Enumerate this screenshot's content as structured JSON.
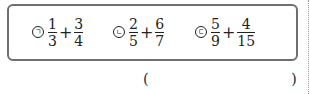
{
  "problem": {
    "options": [
      {
        "marker": "ㄱ",
        "a": {
          "num": "1",
          "den": "3"
        },
        "op": "+",
        "b": {
          "num": "3",
          "den": "4"
        }
      },
      {
        "marker": "ㄴ",
        "a": {
          "num": "2",
          "den": "5"
        },
        "op": "+",
        "b": {
          "num": "6",
          "den": "7"
        }
      },
      {
        "marker": "ㄷ",
        "a": {
          "num": "5",
          "den": "9"
        },
        "op": "+",
        "b": {
          "num": "4",
          "den": "15"
        }
      }
    ],
    "answer": {
      "open": "(",
      "close": ")"
    }
  }
}
